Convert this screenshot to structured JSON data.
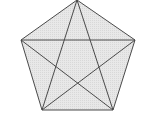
{
  "diagram": {
    "type": "pentagon-with-diagonals",
    "shape": "regular pentagon with inscribed pentagram (all 5 diagonals)",
    "colors": {
      "background": "#ffffff",
      "fill": "#e4e4e4",
      "stroke": "#4a4a4a"
    },
    "vertices": [
      {
        "name": "top",
        "x": 77,
        "y": 0
      },
      {
        "name": "right",
        "x": 135,
        "y": 40
      },
      {
        "name": "bottom-right",
        "x": 113,
        "y": 110
      },
      {
        "name": "bottom-left",
        "x": 42,
        "y": 110
      },
      {
        "name": "left",
        "x": 21,
        "y": 40
      }
    ],
    "edge_count": 5,
    "diagonal_count": 5
  }
}
